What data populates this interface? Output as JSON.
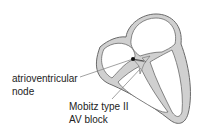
{
  "diagram": {
    "labels": {
      "node_line1": "atrioventricular",
      "node_line2": "node",
      "block_line1": "Mobitz type II",
      "block_line2": "AV block"
    },
    "colors": {
      "wall_fill": "#cfcfcf",
      "outline": "#666666",
      "leader": "#8a8a8a",
      "text": "#222222"
    }
  }
}
